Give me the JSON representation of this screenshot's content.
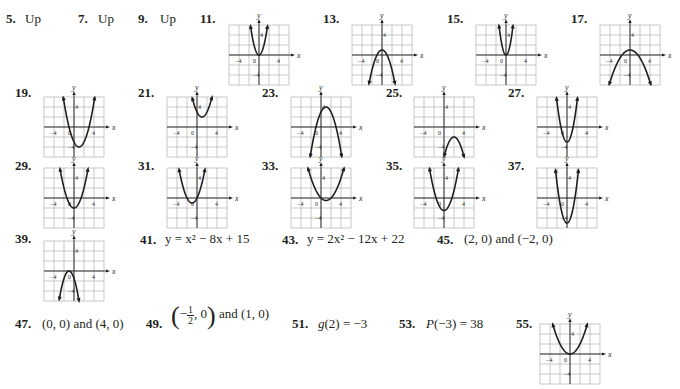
{
  "page": {
    "type": "answer-key",
    "colors": {
      "ink": "#231f20",
      "grid": "#b9b9b9",
      "frame": "#b9b9b9"
    }
  },
  "text_answers": [
    {
      "id": "5",
      "label": "5.",
      "answer": "Up"
    },
    {
      "id": "7",
      "label": "7.",
      "answer": "Up"
    },
    {
      "id": "9",
      "label": "9.",
      "answer": "Up"
    },
    {
      "id": "41",
      "label": "41.",
      "answer": "y = x² − 8x + 15"
    },
    {
      "id": "43",
      "label": "43.",
      "answer": "y = 2x² − 12x + 22"
    },
    {
      "id": "45",
      "label": "45.",
      "answer": "(2, 0) and (−2, 0)"
    },
    {
      "id": "47",
      "label": "47.",
      "answer": "(0, 0) and (4, 0)"
    },
    {
      "id": "49",
      "label": "49.",
      "answer_prefix": "−",
      "frac_num": "1",
      "frac_den": "2",
      "answer_mid": ", 0",
      "answer_suffix": " and (1, 0)"
    },
    {
      "id": "51",
      "label": "51.",
      "answer_fn": "g",
      "answer": "(2) = −3"
    },
    {
      "id": "53",
      "label": "53.",
      "answer_fn": "P",
      "answer": "(−3) = 38"
    }
  ],
  "graph_axes": {
    "x_label": "x",
    "y_label": "y",
    "tick_neg": "−4",
    "tick_pos": "4",
    "origin": "0",
    "y_tick_pos": "4",
    "y_tick_neg": "−4",
    "range": [
      -6,
      6
    ]
  },
  "graph_answers": [
    {
      "id": "11",
      "label": "11.",
      "a": 2,
      "h": 0,
      "k": 0
    },
    {
      "id": "13",
      "label": "13.",
      "a": -1,
      "h": 0,
      "k": 1
    },
    {
      "id": "15",
      "label": "15.",
      "a": 3,
      "h": 0,
      "k": 0
    },
    {
      "id": "17",
      "label": "17.",
      "a": -0.4,
      "h": 0,
      "k": 1
    },
    {
      "id": "19",
      "label": "19.",
      "a": 1,
      "h": 1,
      "k": -4
    },
    {
      "id": "21",
      "label": "21.",
      "a": 1,
      "h": 1,
      "k": 2
    },
    {
      "id": "23",
      "label": "23.",
      "a": -1,
      "h": 1,
      "k": 4
    },
    {
      "id": "25",
      "label": "25.",
      "a": -1,
      "h": 2,
      "k": -2
    },
    {
      "id": "27",
      "label": "27.",
      "a": 2,
      "h": 0,
      "k": -3
    },
    {
      "id": "29",
      "label": "29.",
      "a": 1,
      "h": 0,
      "k": -2
    },
    {
      "id": "31",
      "label": "31.",
      "a": 1,
      "h": -1,
      "k": -1
    },
    {
      "id": "33",
      "label": "33.",
      "a": 0.5,
      "h": 1,
      "k": -0.5
    },
    {
      "id": "35",
      "label": "35.",
      "a": 1,
      "h": 0,
      "k": -2.5
    },
    {
      "id": "37",
      "label": "37.",
      "a": 2,
      "h": 0,
      "k": -5
    },
    {
      "id": "39",
      "label": "39.",
      "a": -1.5,
      "h": -1,
      "k": 0
    },
    {
      "id": "55",
      "label": "55.",
      "a": 0.5,
      "h": 0,
      "k": 0
    }
  ]
}
